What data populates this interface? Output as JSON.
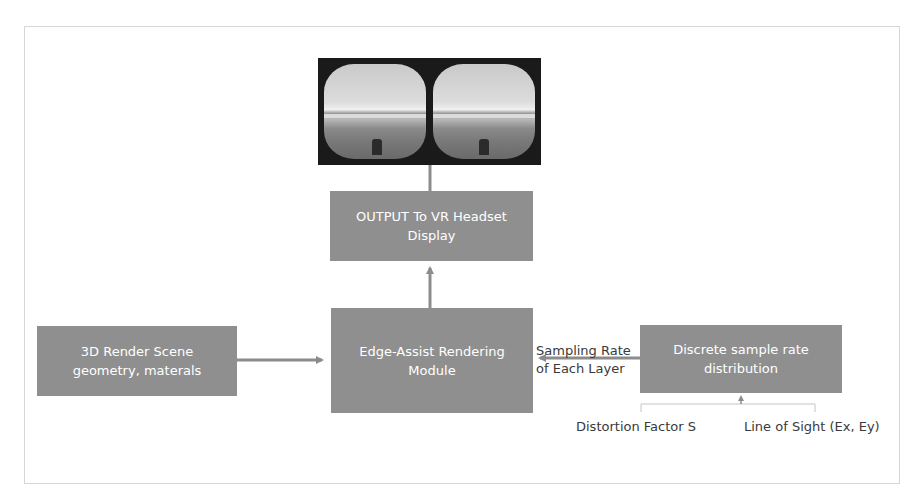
{
  "diagram": {
    "vr_image": {
      "description": "Stereo VR headset view of a beach/shoreline scene (left and right lens)"
    },
    "boxes": {
      "output": "OUTPUT To VR Headset\nDisplay",
      "edge_assist": "Edge-Assist Rendering\nModule",
      "render_scene": "3D Render Scene\ngeometry, materals",
      "discrete": "Discrete sample rate\ndistribution"
    },
    "labels": {
      "sampling_rate": "Sampling Rate\nof Each Layer",
      "distortion": "Distortion Factor S",
      "line_of_sight": "Line of Sight (Ex, Ey)"
    },
    "edges": [
      {
        "from": "render_scene",
        "to": "edge_assist"
      },
      {
        "from": "discrete",
        "to": "edge_assist",
        "label": "Sampling Rate of Each Layer"
      },
      {
        "from": "edge_assist",
        "to": "output"
      },
      {
        "from": "output",
        "to": "vr_image"
      },
      {
        "from": [
          "distortion",
          "line_of_sight"
        ],
        "to": "discrete"
      }
    ],
    "colors": {
      "box_fill": "#8f8f8f",
      "box_text": "#ffffff",
      "arrow": "#8c8c8c",
      "label_text": "#3a3a3a",
      "frame_border": "#d6d6d6"
    }
  }
}
